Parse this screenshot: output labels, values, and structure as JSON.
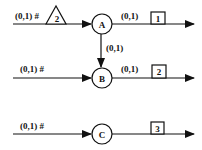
{
  "diagram": {
    "type": "flow-network",
    "rows": [
      {
        "input_label": "(0,1) #",
        "input_marker": {
          "shape": "triangle",
          "label": "2"
        },
        "node": "A",
        "output_label": "(0,1)",
        "output_box": "1"
      },
      {
        "input_label": "(0,1) #",
        "node": "B",
        "output_label": "(0,1)",
        "output_box": "2"
      },
      {
        "input_label": "(0,1) #",
        "node": "C",
        "output_label": "",
        "output_box": "3"
      }
    ],
    "links": [
      {
        "from": "A",
        "to": "B",
        "label": "(0,1)"
      }
    ],
    "colors": {
      "stroke": "#111111",
      "background": "#ffffff"
    }
  }
}
